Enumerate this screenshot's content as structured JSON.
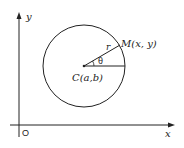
{
  "diagram": {
    "title": "",
    "axes": {
      "x_label": "x",
      "y_label": "y",
      "origin_label": "O"
    },
    "circle": {
      "center_label": "C(a,b)",
      "radius_label": "r",
      "angle_label": "θ",
      "point_label": "M(x, y)"
    },
    "colors": {
      "stroke": "#222222",
      "background": "#ffffff"
    }
  }
}
